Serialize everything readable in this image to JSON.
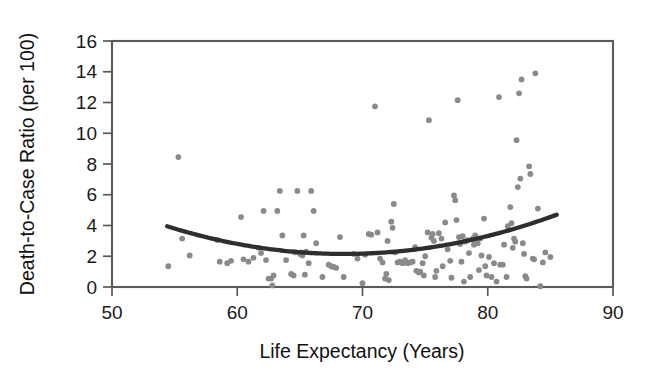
{
  "chart_data": {
    "type": "scatter",
    "title": "",
    "xlabel": "Life Expectancy (Years)",
    "ylabel": "Death-to-Case Ratio (per 100)",
    "xlim": [
      50,
      90
    ],
    "ylim": [
      0,
      16
    ],
    "xticks": [
      50,
      60,
      70,
      80,
      90
    ],
    "yticks": [
      0,
      2,
      4,
      6,
      8,
      10,
      12,
      14,
      16
    ],
    "grid": false,
    "legend": null,
    "point_color": "#8a8a8a",
    "curve_color": "#2e2e2e",
    "frame_color": "#5a5a5a",
    "background": "#ffffff",
    "series": [
      {
        "name": "Countries",
        "marker": "circle",
        "points": [
          [
            54.5,
            1.35
          ],
          [
            55.3,
            8.45
          ],
          [
            55.6,
            3.15
          ],
          [
            56.2,
            2.05
          ],
          [
            58.4,
            3.05
          ],
          [
            58.6,
            1.65
          ],
          [
            59.2,
            1.55
          ],
          [
            59.5,
            1.7
          ],
          [
            60.3,
            4.55
          ],
          [
            60.5,
            1.8
          ],
          [
            60.9,
            1.65
          ],
          [
            61.3,
            1.9
          ],
          [
            61.7,
            2.55
          ],
          [
            61.9,
            2.2
          ],
          [
            62.1,
            4.95
          ],
          [
            62.3,
            1.75
          ],
          [
            62.5,
            0.55
          ],
          [
            62.7,
            0.55
          ],
          [
            62.8,
            0.1
          ],
          [
            62.9,
            0.75
          ],
          [
            63.2,
            4.95
          ],
          [
            63.4,
            6.25
          ],
          [
            63.6,
            3.35
          ],
          [
            63.9,
            1.75
          ],
          [
            64.3,
            0.85
          ],
          [
            64.5,
            0.75
          ],
          [
            64.6,
            2.25
          ],
          [
            64.8,
            6.25
          ],
          [
            65.0,
            2.15
          ],
          [
            65.1,
            2.25
          ],
          [
            65.2,
            2.05
          ],
          [
            65.3,
            3.35
          ],
          [
            65.4,
            0.8
          ],
          [
            65.5,
            2.3
          ],
          [
            65.7,
            1.55
          ],
          [
            65.9,
            6.25
          ],
          [
            66.1,
            4.95
          ],
          [
            66.3,
            2.85
          ],
          [
            66.8,
            0.65
          ],
          [
            67.3,
            1.45
          ],
          [
            67.5,
            1.35
          ],
          [
            67.7,
            1.3
          ],
          [
            67.9,
            1.25
          ],
          [
            68.2,
            3.25
          ],
          [
            68.5,
            0.65
          ],
          [
            69.3,
            2.15
          ],
          [
            69.6,
            1.85
          ],
          [
            70.0,
            0.25
          ],
          [
            70.2,
            2.1
          ],
          [
            70.5,
            3.45
          ],
          [
            70.7,
            3.4
          ],
          [
            71.0,
            11.75
          ],
          [
            71.2,
            3.55
          ],
          [
            71.4,
            1.85
          ],
          [
            71.6,
            1.6
          ],
          [
            71.8,
            0.55
          ],
          [
            71.9,
            0.85
          ],
          [
            72.0,
            3.0
          ],
          [
            72.1,
            0.45
          ],
          [
            72.3,
            4.25
          ],
          [
            72.4,
            3.85
          ],
          [
            72.5,
            5.4
          ],
          [
            72.6,
            2.25
          ],
          [
            72.8,
            1.6
          ],
          [
            73.0,
            1.65
          ],
          [
            73.2,
            1.55
          ],
          [
            73.4,
            1.75
          ],
          [
            73.6,
            1.55
          ],
          [
            73.8,
            1.6
          ],
          [
            74.0,
            1.65
          ],
          [
            74.2,
            2.6
          ],
          [
            74.3,
            1.05
          ],
          [
            74.5,
            0.95
          ],
          [
            74.6,
            1.0
          ],
          [
            74.8,
            1.55
          ],
          [
            74.9,
            0.75
          ],
          [
            75.0,
            2.0
          ],
          [
            75.2,
            3.55
          ],
          [
            75.3,
            10.85
          ],
          [
            75.5,
            3.2
          ],
          [
            75.6,
            3.45
          ],
          [
            75.7,
            3.0
          ],
          [
            75.8,
            0.65
          ],
          [
            75.9,
            1.05
          ],
          [
            76.1,
            3.5
          ],
          [
            76.3,
            3.15
          ],
          [
            76.4,
            1.35
          ],
          [
            76.6,
            4.2
          ],
          [
            76.8,
            2.45
          ],
          [
            77.0,
            1.7
          ],
          [
            77.1,
            0.6
          ],
          [
            77.3,
            5.95
          ],
          [
            77.4,
            5.65
          ],
          [
            77.5,
            4.35
          ],
          [
            77.6,
            12.15
          ],
          [
            77.7,
            3.25
          ],
          [
            77.8,
            2.8
          ],
          [
            77.9,
            1.65
          ],
          [
            78.0,
            3.3
          ],
          [
            78.1,
            0.35
          ],
          [
            78.2,
            2.95
          ],
          [
            78.4,
            3.05
          ],
          [
            78.5,
            2.2
          ],
          [
            78.6,
            0.65
          ],
          [
            78.8,
            3.15
          ],
          [
            78.9,
            2.75
          ],
          [
            79.0,
            3.35
          ],
          [
            79.2,
            2.85
          ],
          [
            79.3,
            1.1
          ],
          [
            79.4,
            3.15
          ],
          [
            79.5,
            2.05
          ],
          [
            79.7,
            4.45
          ],
          [
            79.8,
            1.35
          ],
          [
            79.9,
            0.75
          ],
          [
            80.1,
            1.95
          ],
          [
            80.3,
            0.65
          ],
          [
            80.5,
            1.55
          ],
          [
            80.7,
            0.35
          ],
          [
            80.9,
            12.35
          ],
          [
            81.0,
            1.45
          ],
          [
            81.2,
            1.45
          ],
          [
            81.3,
            2.75
          ],
          [
            81.5,
            0.65
          ],
          [
            81.6,
            3.95
          ],
          [
            81.8,
            5.2
          ],
          [
            81.9,
            4.15
          ],
          [
            82.0,
            2.55
          ],
          [
            82.1,
            3.15
          ],
          [
            82.2,
            2.95
          ],
          [
            82.3,
            9.55
          ],
          [
            82.4,
            6.5
          ],
          [
            82.5,
            12.6
          ],
          [
            82.6,
            7.05
          ],
          [
            82.7,
            13.5
          ],
          [
            82.8,
            2.85
          ],
          [
            82.9,
            2.15
          ],
          [
            83.0,
            0.7
          ],
          [
            83.1,
            0.55
          ],
          [
            83.3,
            7.85
          ],
          [
            83.4,
            7.35
          ],
          [
            83.6,
            1.85
          ],
          [
            83.7,
            1.8
          ],
          [
            83.8,
            13.9
          ],
          [
            84.0,
            5.1
          ],
          [
            84.2,
            0.05
          ],
          [
            84.4,
            1.6
          ],
          [
            84.6,
            2.25
          ],
          [
            85.0,
            1.95
          ]
        ]
      }
    ],
    "fit_curve": {
      "name": "Quadratic trend",
      "type": "quadratic",
      "x_start": 54.4,
      "x_end": 85.5,
      "vertex_x": 68.5,
      "vertex_y": 2.15,
      "y_at_start": 3.95,
      "y_at_end": 4.7
    }
  }
}
